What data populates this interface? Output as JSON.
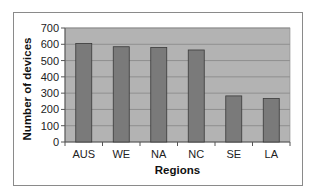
{
  "chart_data": {
    "type": "bar",
    "title": "",
    "xlabel": "Regions",
    "ylabel": "Number of devices",
    "categories": [
      "AUS",
      "WE",
      "NA",
      "NC",
      "SE",
      "LA"
    ],
    "values": [
      605,
      585,
      580,
      565,
      283,
      267
    ],
    "ylim": [
      0,
      700
    ],
    "yticks": [
      0,
      100,
      200,
      300,
      400,
      500,
      600,
      700
    ],
    "grid": true,
    "legend": null,
    "colors": {
      "plot_background": "#b3b3b3",
      "bar_fill": "#7a7a7a",
      "bar_stroke": "#3a3a3a",
      "gridline": "#8f8f8f"
    }
  }
}
